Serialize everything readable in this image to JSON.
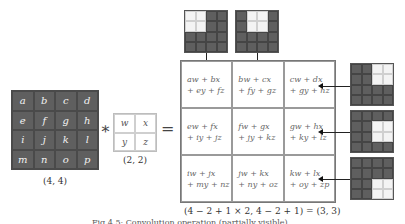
{
  "input": {
    "cells": [
      "a",
      "b",
      "c",
      "d",
      "e",
      "f",
      "g",
      "h",
      "i",
      "j",
      "k",
      "l",
      "m",
      "n",
      "o",
      "p"
    ],
    "shape_label": "(4, 4)"
  },
  "operator_convolve": "∗",
  "kernel": {
    "cells": [
      "w",
      "x",
      "y",
      "z"
    ],
    "shape_label": "(2, 2)"
  },
  "operator_equals": "=",
  "output": {
    "cells": [
      {
        "line1": "aw + bx",
        "line2": "+ ey + fz"
      },
      {
        "line1": "bw + cx",
        "line2": "+ fy + gz"
      },
      {
        "line1": "cw + dx",
        "line2": "+ gy + hz"
      },
      {
        "line1": "ew + fx",
        "line2": "+ iy + jz"
      },
      {
        "line1": "fw + gx",
        "line2": "+ jy + kz"
      },
      {
        "line1": "gw + hx",
        "line2": "+ ky + lz"
      },
      {
        "line1": "iw + jx",
        "line2": "+ my + nz"
      },
      {
        "line1": "jw + kx",
        "line2": "+ ny + oz"
      },
      {
        "line1": "kw + lx",
        "line2": "+ oy + zp"
      }
    ],
    "shape_formula": "(4 − 2 + 1 × 2, 4 − 2 + 1) = (3, 3)"
  },
  "receptive_field_examples": {
    "top": [
      {
        "highlight": [
          0,
          1,
          4,
          5
        ],
        "points_to_cell": 0
      },
      {
        "highlight": [
          1,
          2,
          5,
          6
        ],
        "points_to_cell": 1
      }
    ],
    "right": [
      {
        "highlight": [
          2,
          3,
          6,
          7
        ],
        "points_to_cell": 2
      },
      {
        "highlight": [
          6,
          7,
          10,
          11
        ],
        "points_to_cell": 5
      },
      {
        "highlight": [
          10,
          11,
          14,
          15
        ],
        "points_to_cell": 8
      }
    ]
  },
  "caption": "Fig 4.5: Convolution operation (partially visible)",
  "colors": {
    "dark_cell": "#5f5f5f",
    "highlight_cell": "#f4f4f4",
    "grid_line": "#9a9a9a"
  }
}
